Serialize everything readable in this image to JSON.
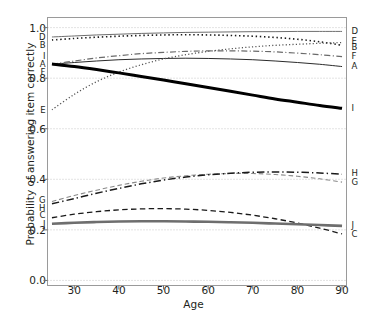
{
  "chart_data": {
    "type": "line",
    "title": "",
    "xlabel": "Age",
    "ylabel": "Probability of answering item correctly",
    "xlim": [
      24,
      91
    ],
    "ylim": [
      -0.02,
      1.04
    ],
    "xticks": [
      30,
      40,
      50,
      60,
      70,
      80,
      90
    ],
    "yticks": [
      "0.0",
      "0.2",
      "0.4",
      "0.6",
      "0.8",
      "1.0"
    ],
    "ytick_values": [
      0.0,
      0.2,
      0.4,
      0.6,
      0.8,
      1.0
    ],
    "grid": true,
    "grid_style": "dotted horizontal",
    "legend": "inline end-labels on both sides",
    "x": [
      25,
      30,
      35,
      40,
      45,
      50,
      55,
      60,
      65,
      70,
      75,
      80,
      85,
      90
    ],
    "series": [
      {
        "name": "A",
        "label_left": "A",
        "label_right": "A",
        "style": "solid",
        "width": 1.0,
        "color": "#2b2b2b",
        "values": [
          0.855,
          0.862,
          0.868,
          0.873,
          0.876,
          0.878,
          0.879,
          0.878,
          0.876,
          0.873,
          0.868,
          0.862,
          0.855,
          0.846
        ]
      },
      {
        "name": "B",
        "label_left": "B",
        "label_right": "B",
        "style": "dotted",
        "width": 1.6,
        "color": "#1a1a1a",
        "values": [
          0.951,
          0.957,
          0.962,
          0.966,
          0.969,
          0.971,
          0.972,
          0.971,
          0.969,
          0.966,
          0.961,
          0.954,
          0.944,
          0.93
        ]
      },
      {
        "name": "C",
        "label_left": "C",
        "label_right": "C",
        "style": "dashed",
        "width": 1.3,
        "color": "#1a1a1a",
        "values": [
          0.248,
          0.262,
          0.272,
          0.279,
          0.283,
          0.284,
          0.282,
          0.277,
          0.269,
          0.258,
          0.244,
          0.227,
          0.207,
          0.184
        ]
      },
      {
        "name": "D",
        "label_left": "D",
        "label_right": "D",
        "style": "solid",
        "width": 1.0,
        "color": "#6e6e6e",
        "values": [
          0.963,
          0.967,
          0.971,
          0.974,
          0.977,
          0.979,
          0.981,
          0.982,
          0.983,
          0.984,
          0.984,
          0.985,
          0.985,
          0.985
        ]
      },
      {
        "name": "E",
        "label_left": "E",
        "label_right": "E",
        "style": "dotted",
        "width": 1.3,
        "color": "#555555",
        "values": [
          0.675,
          0.736,
          0.786,
          0.824,
          0.853,
          0.876,
          0.893,
          0.906,
          0.916,
          0.924,
          0.93,
          0.934,
          0.938,
          0.941
        ]
      },
      {
        "name": "F",
        "label_left": "F",
        "label_right": "F",
        "style": "dashdot",
        "width": 1.2,
        "color": "#6a6a6a",
        "values": [
          0.855,
          0.868,
          0.88,
          0.889,
          0.897,
          0.902,
          0.906,
          0.908,
          0.908,
          0.907,
          0.904,
          0.899,
          0.893,
          0.885
        ]
      },
      {
        "name": "G",
        "label_left": "G",
        "label_right": "G",
        "style": "dashed",
        "width": 1.1,
        "color": "#8a8a8a",
        "values": [
          0.312,
          0.336,
          0.357,
          0.376,
          0.392,
          0.405,
          0.414,
          0.42,
          0.423,
          0.423,
          0.419,
          0.412,
          0.402,
          0.389
        ]
      },
      {
        "name": "H",
        "label_left": "H",
        "label_right": "H",
        "style": "dashdot",
        "width": 1.5,
        "color": "#1a1a1a",
        "values": [
          0.303,
          0.324,
          0.345,
          0.364,
          0.382,
          0.397,
          0.409,
          0.418,
          0.424,
          0.428,
          0.429,
          0.428,
          0.425,
          0.42
        ]
      },
      {
        "name": "I",
        "label_left": "I",
        "label_right": "I",
        "style": "solid",
        "width": 3.0,
        "color": "#000000",
        "values": [
          0.856,
          0.846,
          0.834,
          0.821,
          0.807,
          0.793,
          0.778,
          0.763,
          0.748,
          0.733,
          0.718,
          0.705,
          0.692,
          0.681
        ]
      },
      {
        "name": "J",
        "label_left": "J",
        "label_right": "J",
        "style": "solid",
        "width": 2.6,
        "color": "#6e6e6e",
        "values": [
          0.224,
          0.228,
          0.231,
          0.233,
          0.234,
          0.234,
          0.233,
          0.232,
          0.23,
          0.228,
          0.225,
          0.222,
          0.219,
          0.216
        ]
      }
    ],
    "left_labels": [
      {
        "name": "D",
        "y": 0.963
      },
      {
        "name": "B",
        "y": 0.933
      },
      {
        "name": "I",
        "y": 0.888
      },
      {
        "name": "A",
        "y": 0.857
      },
      {
        "name": "F",
        "y": 0.826
      },
      {
        "name": "E",
        "y": 0.675
      },
      {
        "name": "G",
        "y": 0.318
      },
      {
        "name": "H",
        "y": 0.288
      },
      {
        "name": "C",
        "y": 0.258
      },
      {
        "name": "J",
        "y": 0.222
      }
    ],
    "right_labels": [
      {
        "name": "D",
        "y": 0.985
      },
      {
        "name": "E",
        "y": 0.948
      },
      {
        "name": "B",
        "y": 0.922
      },
      {
        "name": "F",
        "y": 0.886
      },
      {
        "name": "A",
        "y": 0.848
      },
      {
        "name": "I",
        "y": 0.681
      },
      {
        "name": "H",
        "y": 0.424
      },
      {
        "name": "G",
        "y": 0.388
      },
      {
        "name": "J",
        "y": 0.218
      },
      {
        "name": "C",
        "y": 0.182
      }
    ]
  }
}
